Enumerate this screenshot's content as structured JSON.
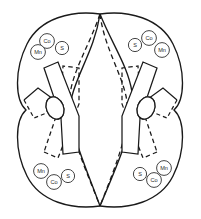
{
  "figure": {
    "background_color": "#ffffff",
    "line_color": "#1a1a1a",
    "label_stroke_color": "#3a3a3a",
    "hatch_color": "#555555"
  },
  "labels": {
    "quadrant_top_left": [
      {
        "text": "Co",
        "cx": 47,
        "cy": 41,
        "r": 7.4
      },
      {
        "text": "S",
        "cx": 62,
        "cy": 48,
        "r": 6.6
      },
      {
        "text": "Mn",
        "cx": 38,
        "cy": 52,
        "r": 7.4
      }
    ],
    "quadrant_top_right": [
      {
        "text": "S",
        "cx": 135,
        "cy": 45,
        "r": 6.6
      },
      {
        "text": "Co",
        "cx": 149,
        "cy": 38,
        "r": 7.4
      },
      {
        "text": "Mn",
        "cx": 162,
        "cy": 50,
        "r": 7.4
      }
    ],
    "quadrant_bottom_left": [
      {
        "text": "Mn",
        "cx": 41,
        "cy": 171,
        "r": 7.4
      },
      {
        "text": "Co",
        "cx": 54,
        "cy": 182,
        "r": 7.4
      },
      {
        "text": "S",
        "cx": 68,
        "cy": 176,
        "r": 6.6
      }
    ],
    "quadrant_bottom_right": [
      {
        "text": "S",
        "cx": 140,
        "cy": 174,
        "r": 6.6
      },
      {
        "text": "Co",
        "cx": 154,
        "cy": 180,
        "r": 7.4
      },
      {
        "text": "Mn",
        "cx": 164,
        "cy": 168,
        "r": 7.4
      }
    ]
  },
  "geometry": {
    "lobe_left": "M 100 14 C 72 10 40 18 27 44 C 14 70 15 100 26 110 C 15 120 14 150 27 176 C 40 202 72 210 100 206",
    "lobe_right": "M 100 14 C 128 10 160 18 173 44 C 186 70 185 100 174 110 C 185 120 186 150 173 176 C 160 202 128 210 100 206",
    "curve_cross_solid_a": "M 100 14 C 95 48 78 72 72 96 C 66 124 80 152 100 206",
    "curve_cross_solid_b": "M 100 14 C 112 44 128 66 132 92 C 137 122 120 158 100 206",
    "curve_cross_dashed_a": "M 100 14 C 104 46 120 70 126 96 C 132 126 118 160 100 206",
    "curve_cross_dashed_b": "M 100 14 C 90 44 74 68 70 94 C 65 124 82 160 100 206",
    "ribbon_left_solid": "M 44 68 L 58 62 L 79 116 L 79 152 L 63 154 L 61 118 Z",
    "ribbon_right_solid": "M 157 68 L 143 62 L 122 116 L 122 152 L 138 154 L 140 118 Z",
    "ribbon_left_dashed": "M 44 152 L 58 158 L 79 104 L 79 68 L 63 66 L 61 102 Z",
    "ribbon_right_dashed": "M 157 152 L 143 158 L 122 104 L 122 68 L 138 66 L 140 102 Z",
    "zigzag_left_solid": "M 24 100 L 38 88 L 60 104 L 70 96",
    "zigzag_left_dashed": "M 24 100 L 34 118 L 54 110 L 68 120",
    "zigzag_right_solid": "M 177 100 L 163 88 L 141 104 L 131 96",
    "zigzag_right_dashed": "M 177 100 L 167 118 L 147 110 L 133 120",
    "inclusion_left": {
      "cx": 55,
      "cy": 108,
      "rx": 8.5,
      "ry": 11.5,
      "rotate": -22
    },
    "inclusion_right": {
      "cx": 146,
      "cy": 108,
      "rx": 8.5,
      "ry": 11.5,
      "rotate": 22
    }
  }
}
